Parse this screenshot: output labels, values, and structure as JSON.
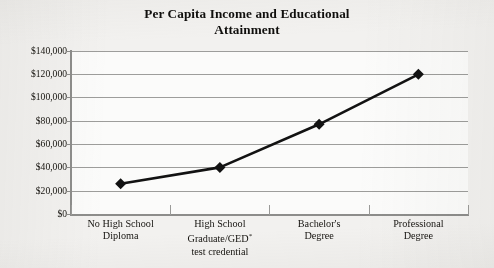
{
  "chart_data": {
    "type": "line",
    "title": "Per Capita Income and Educational Attainment",
    "title_lines": [
      "Per Capita Income and Educational",
      "Attainment"
    ],
    "categories": [
      "No High School Diploma",
      "High School Graduate/GED* test credential",
      "Bachelor's Degree",
      "Professional Degree"
    ],
    "category_lines": [
      [
        "No High School",
        "Diploma"
      ],
      [
        "High School",
        "Graduate/GED*",
        "test credential"
      ],
      [
        "Bachelor's",
        "Degree"
      ],
      [
        "Professional",
        "Degree"
      ]
    ],
    "values": [
      26000,
      40000,
      77000,
      120000
    ],
    "xlabel": "",
    "ylabel": "",
    "ylim": [
      0,
      140000
    ],
    "ytick_values": [
      140000,
      120000,
      100000,
      80000,
      60000,
      40000,
      20000,
      0
    ],
    "ytick_labels": [
      "$140,000",
      "$120,000",
      "$100,000",
      "$80,000",
      "$60,000",
      "$40,000",
      "$20,000",
      "$0"
    ],
    "grid": true,
    "legend": false,
    "marker": "diamond",
    "series_color": "#121212",
    "gridline_color": "#9d9d9b",
    "plot_background": "#fbfbfa",
    "page_background": "#f2f1ef",
    "footnote_symbol": "*"
  }
}
